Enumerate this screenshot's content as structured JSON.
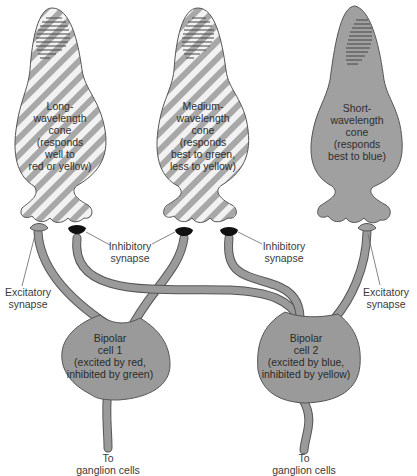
{
  "diagram": {
    "colors": {
      "cell_fill": "#9a9a9a",
      "stripe_light": "#f2f2f2",
      "stripe_dark": "#a8a8a8",
      "outline": "#555555",
      "synapse_inhibitory": "#111111",
      "leader_line": "#666666"
    },
    "cones": [
      {
        "id": "long",
        "lines": [
          "Long-",
          "wavelength",
          "cone",
          "(responds",
          "well to",
          "red or yellow)"
        ],
        "fill": "striped"
      },
      {
        "id": "medium",
        "lines": [
          "Medium-",
          "wavelength",
          "cone",
          "(responds",
          "best to green,",
          "less to yellow)"
        ],
        "fill": "striped"
      },
      {
        "id": "short",
        "lines": [
          "Short-",
          "wavelength",
          "cone",
          "(responds",
          "best to blue)"
        ],
        "fill": "solid"
      }
    ],
    "bipolar_cells": [
      {
        "id": "bipolar-1",
        "lines": [
          "Bipolar",
          "cell 1",
          "(excited by red,",
          "inhibited by green)"
        ],
        "output": [
          "To",
          "ganglion cells"
        ]
      },
      {
        "id": "bipolar-2",
        "lines": [
          "Bipolar",
          "cell 2",
          "(excited by blue,",
          "inhibited by yellow)"
        ],
        "output": [
          "To",
          "ganglion cells"
        ]
      }
    ],
    "synapse_labels": {
      "excitatory_left": [
        "Excitatory",
        "synapse"
      ],
      "inhibitory_left": [
        "Inhibitory",
        "synapse"
      ],
      "inhibitory_right": [
        "Inhibitory",
        "synapse"
      ],
      "excitatory_right": [
        "Excitatory",
        "synapse"
      ]
    }
  }
}
